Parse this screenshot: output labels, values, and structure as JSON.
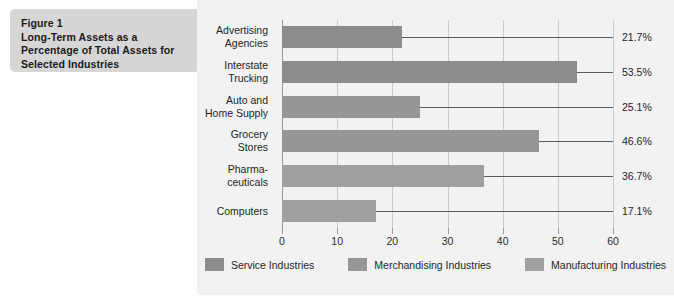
{
  "figure": {
    "title_lines": [
      "Figure 1",
      "Long-Term Assets as a",
      "Percentage of Total Assets for",
      "Selected Industries"
    ]
  },
  "colors": {
    "panel_background": "#f2f2f2",
    "title_background": "#d6d6d6",
    "service": "#8c8c8c",
    "merchandising": "#969696",
    "manufacturing": "#a0a0a0",
    "gridline": "#c9c9c9",
    "axis": "#9a9a9a",
    "text": "#1f1f1f"
  },
  "chart_data": {
    "type": "bar",
    "orientation": "horizontal",
    "title": "Long-Term Assets as a Percentage of Total Assets for Selected Industries",
    "xlabel": "",
    "ylabel": "",
    "xlim": [
      0,
      60
    ],
    "xticks": [
      "0",
      "10",
      "20",
      "30",
      "40",
      "50",
      "60"
    ],
    "grid": true,
    "legend_position": "bottom",
    "categories": [
      "Advertising\nAgencies",
      "Interstate\nTrucking",
      "Auto and\nHome Supply",
      "Grocery\nStores",
      "Pharma-\nceuticals",
      "Computers"
    ],
    "values": [
      21.7,
      53.5,
      25.1,
      46.6,
      36.7,
      17.1
    ],
    "value_labels": [
      "21.7%",
      "53.5%",
      "25.1%",
      "46.6%",
      "36.7%",
      "17.1%"
    ],
    "series_of_bar": [
      "service",
      "service",
      "merchandising",
      "merchandising",
      "manufacturing",
      "manufacturing"
    ],
    "legend": [
      {
        "key": "service",
        "label": "Service Industries",
        "color": "#8c8c8c"
      },
      {
        "key": "merchandising",
        "label": "Merchandising Industries",
        "color": "#969696"
      },
      {
        "key": "manufacturing",
        "label": "Manufacturing Industries",
        "color": "#a0a0a0"
      }
    ]
  }
}
